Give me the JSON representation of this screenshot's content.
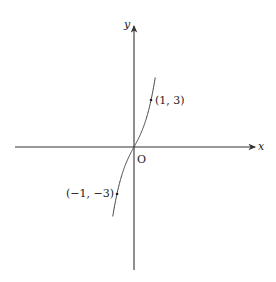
{
  "chart_data": {
    "type": "line",
    "title": "",
    "xlabel": "x",
    "ylabel": "y",
    "origin_label": "O",
    "function": "y = x^3 + 2x",
    "annotated_points": [
      {
        "x": 1,
        "y": 3,
        "label": "(1, 3)"
      },
      {
        "x": -1,
        "y": -3,
        "label": "(−1, −3)"
      }
    ],
    "series": [
      {
        "name": "curve",
        "x": [
          -1.45,
          -1.2,
          -1,
          -0.5,
          0,
          0.5,
          1,
          1.2,
          1.45
        ],
        "y": [
          -5.95,
          -4.13,
          -3,
          -1.125,
          0,
          1.125,
          3,
          4.13,
          5.95
        ]
      }
    ],
    "grid": false,
    "colors": {
      "axis": "#333333",
      "curve": "#444444"
    }
  }
}
